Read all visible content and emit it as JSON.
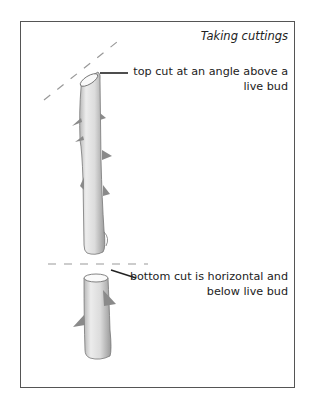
{
  "diagram": {
    "title": "Taking cuttings",
    "labels": {
      "top_cut": {
        "line1": "top cut at an angle above a",
        "line2": "live bud"
      },
      "bottom_cut": {
        "line1": "bottom cut is horizontal and",
        "line2": "below live bud"
      }
    },
    "elements": [
      "upper-stem-cutting",
      "lower-stem-cutting",
      "angled-cut-guide-line",
      "horizontal-cut-guide-line",
      "thorns"
    ],
    "colors": {
      "frame": "#555555",
      "stem_fill": "#e8e8e8",
      "stem_shade": "#a8a8a8",
      "thorn": "#8a8a8a",
      "guide_dash": "#999999",
      "leader_line": "#222222",
      "text": "#222222"
    }
  }
}
